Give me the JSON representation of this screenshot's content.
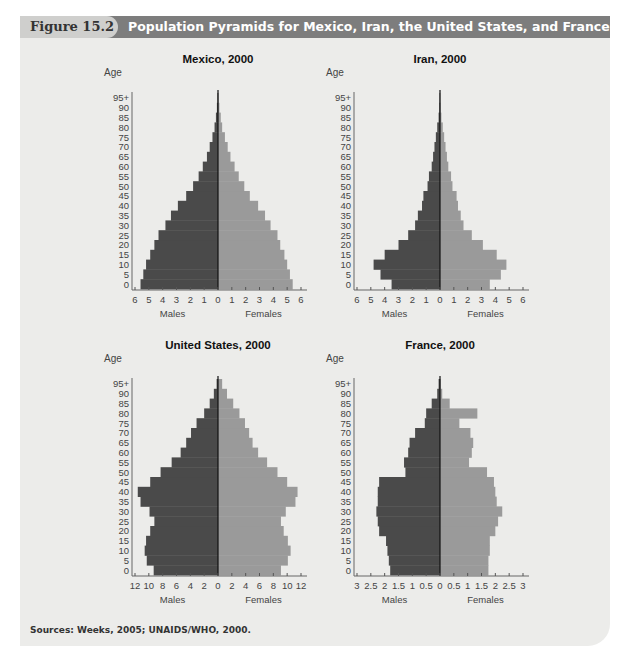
{
  "figure": {
    "label": "Figure 15.2",
    "title": "Population Pyramids for Mexico, Iran, the United States, and France",
    "sources": "Sources: Weeks, 2005; UNAIDS/WHO, 2000."
  },
  "colors": {
    "male": "#4a4a4a",
    "female": "#9a9a9a",
    "panel": "#ececea",
    "header": "#7d7d7d",
    "label_bg": "#cfcfcd"
  },
  "chart_data": [
    {
      "type": "bar",
      "orientation": "population-pyramid",
      "title": "Mexico, 2000",
      "ylabel": "Age",
      "xlabel_left": "Males\n(in millions)",
      "xlabel_right": "Females\n(in millions)",
      "age_groups": [
        "0",
        "5",
        "10",
        "15",
        "20",
        "25",
        "30",
        "35",
        "40",
        "45",
        "50",
        "55",
        "60",
        "65",
        "70",
        "75",
        "80",
        "85",
        "90",
        "95+"
      ],
      "xmax": 6,
      "x_ticks": [
        "6",
        "5",
        "4",
        "3",
        "2",
        "1",
        "0",
        "1",
        "2",
        "3",
        "4",
        "5",
        "6"
      ],
      "series": [
        {
          "name": "Males",
          "values": [
            5.6,
            5.4,
            5.2,
            4.9,
            4.6,
            4.3,
            3.8,
            3.4,
            2.9,
            2.3,
            1.8,
            1.4,
            1.1,
            0.8,
            0.6,
            0.4,
            0.25,
            0.15,
            0.08,
            0.04
          ]
        },
        {
          "name": "Females",
          "values": [
            5.4,
            5.2,
            5.0,
            4.8,
            4.5,
            4.3,
            3.8,
            3.4,
            2.9,
            2.3,
            1.9,
            1.5,
            1.2,
            0.9,
            0.7,
            0.5,
            0.3,
            0.2,
            0.1,
            0.05
          ]
        }
      ]
    },
    {
      "type": "bar",
      "orientation": "population-pyramid",
      "title": "Iran, 2000",
      "ylabel": "Age",
      "xlabel_left": "Males\n(in millions)",
      "xlabel_right": "Females\n(in millions)",
      "age_groups": [
        "0",
        "5",
        "10",
        "15",
        "20",
        "25",
        "30",
        "35",
        "40",
        "45",
        "50",
        "55",
        "60",
        "65",
        "70",
        "75",
        "80",
        "85",
        "90",
        "95+"
      ],
      "xmax": 6,
      "x_ticks": [
        "6",
        "5",
        "4",
        "3",
        "2",
        "1",
        "0",
        "1",
        "2",
        "3",
        "4",
        "5",
        "6"
      ],
      "series": [
        {
          "name": "Males",
          "values": [
            3.5,
            4.3,
            4.8,
            4.0,
            3.0,
            2.3,
            1.8,
            1.6,
            1.3,
            1.2,
            0.9,
            0.8,
            0.6,
            0.5,
            0.4,
            0.3,
            0.2,
            0.1,
            0.05,
            0.03
          ]
        },
        {
          "name": "Females",
          "values": [
            3.6,
            4.4,
            4.8,
            4.1,
            3.1,
            2.3,
            1.7,
            1.5,
            1.3,
            1.2,
            0.9,
            0.8,
            0.6,
            0.5,
            0.4,
            0.3,
            0.2,
            0.1,
            0.05,
            0.03
          ]
        }
      ]
    },
    {
      "type": "bar",
      "orientation": "population-pyramid",
      "title": "United States, 2000",
      "ylabel": "Age",
      "xlabel_left": "Males\n(in millions)",
      "xlabel_right": "Females\n(in millions)",
      "age_groups": [
        "0",
        "5",
        "10",
        "15",
        "20",
        "25",
        "30",
        "35",
        "40",
        "45",
        "50",
        "55",
        "60",
        "65",
        "70",
        "75",
        "80",
        "85",
        "90",
        "95+"
      ],
      "xmax": 12,
      "x_ticks": [
        "12",
        "10",
        "8",
        "6",
        "4",
        "2",
        "0",
        "2",
        "4",
        "6",
        "8",
        "10",
        "12"
      ],
      "series": [
        {
          "name": "Males",
          "values": [
            9.3,
            10.3,
            10.6,
            10.4,
            9.8,
            9.2,
            9.9,
            11.2,
            11.6,
            9.8,
            8.3,
            6.7,
            5.4,
            4.6,
            3.9,
            3.1,
            2.0,
            1.2,
            0.6,
            0.2
          ]
        },
        {
          "name": "Females",
          "values": [
            9.1,
            10.1,
            10.5,
            10.1,
            9.5,
            9.1,
            9.8,
            11.2,
            11.5,
            10.0,
            8.6,
            7.1,
            5.8,
            5.0,
            4.5,
            3.9,
            3.1,
            2.2,
            1.3,
            0.6
          ]
        }
      ]
    },
    {
      "type": "bar",
      "orientation": "population-pyramid",
      "title": "France, 2000",
      "ylabel": "Age",
      "xlabel_left": "Males\n(in millions)",
      "xlabel_right": "Females\n(in millions)",
      "age_groups": [
        "0",
        "5",
        "10",
        "15",
        "20",
        "25",
        "30",
        "35",
        "40",
        "45",
        "50",
        "55",
        "60",
        "65",
        "70",
        "75",
        "80",
        "85",
        "90",
        "95+"
      ],
      "xmax": 3,
      "x_ticks": [
        "3",
        "2.5",
        "2",
        "1.5",
        "1",
        "0.5",
        "0",
        "0.5",
        "1",
        "1.5",
        "2",
        "2.5",
        "3"
      ],
      "series": [
        {
          "name": "Males",
          "values": [
            1.8,
            1.85,
            1.9,
            1.95,
            2.2,
            2.25,
            2.3,
            2.25,
            2.25,
            2.2,
            1.25,
            1.3,
            1.15,
            1.1,
            0.9,
            0.55,
            0.5,
            0.3,
            0.1,
            0.05
          ]
        },
        {
          "name": "Females",
          "values": [
            1.75,
            1.75,
            1.8,
            1.8,
            2.0,
            2.1,
            2.25,
            2.05,
            2.0,
            1.95,
            1.7,
            1.05,
            1.15,
            1.2,
            1.1,
            0.7,
            1.35,
            0.35,
            0.08,
            0.03
          ]
        }
      ]
    }
  ]
}
